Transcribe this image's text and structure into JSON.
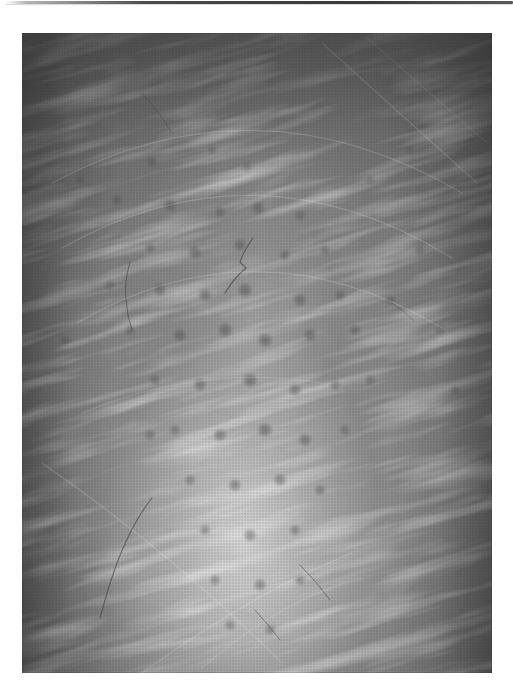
{
  "page": {
    "background_color": "#ffffff",
    "top_rule_color": "#3f3f3f"
  },
  "photo": {
    "subject": "close-up grayscale photograph of human skin showing hair follicles, pores and fine hairs",
    "orientation": "portrait",
    "colors": {
      "edge_shadow": "#676767",
      "midtone": "#8a8a8a",
      "highlight": "#c9c9c9",
      "pore": "#343434",
      "hair": "#3d3d3d",
      "streak_highlight": "#f2f2f2"
    },
    "pores": [
      [
        130,
        129,
        6,
        0.3
      ],
      [
        190,
        117,
        5,
        0.26
      ],
      [
        225,
        134,
        6,
        0.28
      ],
      [
        95,
        167,
        6,
        0.3
      ],
      [
        148,
        172,
        7,
        0.34
      ],
      [
        198,
        179,
        6,
        0.32
      ],
      [
        236,
        175,
        7,
        0.34
      ],
      [
        278,
        182,
        6,
        0.3
      ],
      [
        128,
        215,
        6,
        0.32
      ],
      [
        173,
        219,
        7,
        0.36
      ],
      [
        218,
        212,
        7,
        0.38
      ],
      [
        263,
        222,
        6,
        0.34
      ],
      [
        303,
        217,
        6,
        0.3
      ],
      [
        88,
        252,
        6,
        0.28
      ],
      [
        138,
        257,
        7,
        0.36
      ],
      [
        183,
        262,
        7,
        0.4
      ],
      [
        223,
        257,
        8,
        0.42
      ],
      [
        278,
        267,
        7,
        0.38
      ],
      [
        318,
        262,
        6,
        0.32
      ],
      [
        108,
        297,
        6,
        0.3
      ],
      [
        158,
        302,
        7,
        0.38
      ],
      [
        203,
        297,
        8,
        0.42
      ],
      [
        243,
        307,
        8,
        0.44
      ],
      [
        288,
        302,
        7,
        0.38
      ],
      [
        333,
        297,
        6,
        0.3
      ],
      [
        133,
        347,
        6,
        0.34
      ],
      [
        178,
        352,
        7,
        0.4
      ],
      [
        228,
        347,
        8,
        0.44
      ],
      [
        273,
        357,
        7,
        0.4
      ],
      [
        313,
        352,
        6,
        0.34
      ],
      [
        153,
        397,
        6,
        0.34
      ],
      [
        198,
        402,
        7,
        0.42
      ],
      [
        243,
        397,
        8,
        0.45
      ],
      [
        283,
        407,
        7,
        0.4
      ],
      [
        323,
        397,
        6,
        0.32
      ],
      [
        168,
        447,
        6,
        0.36
      ],
      [
        213,
        452,
        7,
        0.42
      ],
      [
        258,
        447,
        7,
        0.42
      ],
      [
        298,
        457,
        6,
        0.36
      ],
      [
        183,
        497,
        6,
        0.36
      ],
      [
        228,
        502,
        7,
        0.42
      ],
      [
        273,
        497,
        6,
        0.38
      ],
      [
        193,
        547,
        6,
        0.36
      ],
      [
        238,
        552,
        7,
        0.4
      ],
      [
        278,
        547,
        6,
        0.36
      ],
      [
        208,
        592,
        6,
        0.34
      ],
      [
        248,
        597,
        6,
        0.34
      ],
      [
        128,
        402,
        6,
        0.32
      ],
      [
        348,
        347,
        6,
        0.3
      ],
      [
        368,
        267,
        6,
        0.28
      ],
      [
        398,
        217,
        6,
        0.26
      ],
      [
        58,
        147,
        5,
        0.24
      ],
      [
        348,
        147,
        5,
        0.24
      ],
      [
        388,
        117,
        5,
        0.22
      ],
      [
        43,
        307,
        5,
        0.24
      ],
      [
        418,
        297,
        6,
        0.26
      ],
      [
        433,
        357,
        5,
        0.24
      ]
    ],
    "fibers": [
      {
        "d": "M231,205 q-10,14 -13,24 l6,6 q-12,10 -21,25",
        "w": 1.1,
        "o": 0.65,
        "c": "#3d3d3d"
      },
      {
        "d": "M108,229 q-6,20 -4,38 q1,16 6,30",
        "w": 1.0,
        "o": 0.55,
        "c": "#3d3d3d"
      },
      {
        "d": "M78,585 C 90,540 104,498 130,465",
        "w": 1.2,
        "o": 0.55,
        "c": "#3d3d3d"
      },
      {
        "d": "M278,532 q16,16 30,35",
        "w": 1.0,
        "o": 0.5,
        "c": "#3d3d3d"
      },
      {
        "d": "M233,577 q13,14 25,30",
        "w": 1.0,
        "o": 0.45,
        "c": "#3d3d3d"
      },
      {
        "d": "M120,60 q18,20 30,40",
        "w": 0.9,
        "o": 0.35,
        "c": "#3d3d3d"
      },
      {
        "d": "M370,270 q12,8 22,18",
        "w": 0.9,
        "o": 0.35,
        "c": "#3d3d3d"
      },
      {
        "d": "M30,150 Q 235,40 440,160",
        "w": 1.2,
        "o": 0.22,
        "c": "#f2f2f2"
      },
      {
        "d": "M40,215 Q 235,105 430,225",
        "w": 1.2,
        "o": 0.2,
        "c": "#f2f2f2"
      },
      {
        "d": "M55,290 Q 235,185 420,295",
        "w": 1.2,
        "o": 0.18,
        "c": "#f2f2f2"
      },
      {
        "d": "M300,10 L 455,150",
        "w": 1.1,
        "o": 0.22,
        "c": "#f2f2f2"
      },
      {
        "d": "M345,5 L 465,110",
        "w": 1.0,
        "o": 0.2,
        "c": "#f2f2f2"
      },
      {
        "d": "M20,430 Q 150,520 260,630",
        "w": 1.2,
        "o": 0.2,
        "c": "#f2f2f2"
      },
      {
        "d": "M120,640 Q 230,560 330,520",
        "w": 1.1,
        "o": 0.22,
        "c": "#f2f2f2"
      },
      {
        "d": "M180,635 Q 260,565 340,545",
        "w": 1.0,
        "o": 0.2,
        "c": "#f2f2f2"
      },
      {
        "d": "M60,380 Q 180,330 300,350",
        "w": 1.0,
        "o": 0.15,
        "c": "#f2f2f2"
      }
    ]
  }
}
